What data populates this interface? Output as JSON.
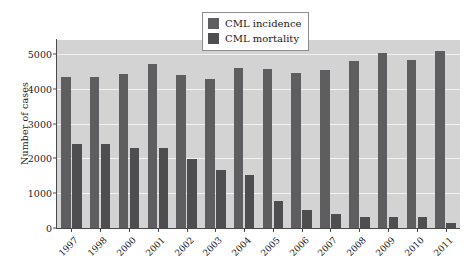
{
  "chart_data": {
    "type": "bar",
    "title": "",
    "subtitle": "",
    "xlabel": "",
    "ylabel": "Number of cases",
    "ylim": [
      0,
      5400
    ],
    "yticks": [
      0,
      1000,
      2000,
      3000,
      4000,
      5000
    ],
    "ytick_labels": [
      "0",
      "1000",
      "2000",
      "3000",
      "4000",
      "5000"
    ],
    "grid": true,
    "grid_axis": "y",
    "legend_position": "top-center",
    "categories": [
      "1997",
      "1998",
      "2000",
      "2001",
      "2002",
      "2003",
      "2004",
      "2005",
      "2006",
      "2007",
      "2008",
      "2009",
      "2010",
      "2011"
    ],
    "series": [
      {
        "name": "CML incidence",
        "color": "#5e5e60",
        "values": [
          4340,
          4340,
          4420,
          4700,
          4400,
          4280,
          4600,
          4580,
          4460,
          4540,
          4800,
          5020,
          4820,
          5080
        ]
      },
      {
        "name": "CML mortality",
        "color": "#4e4e50",
        "values": [
          2400,
          2400,
          2290,
          2290,
          1990,
          1660,
          1530,
          780,
          510,
          400,
          330,
          320,
          310,
          150
        ]
      }
    ]
  },
  "legend": {
    "items": [
      {
        "label": "CML incidence",
        "swatch_color": "#5e5e60",
        "icon": "legend-swatch-icon"
      },
      {
        "label": "CML mortality",
        "swatch_color": "#4e4e50",
        "icon": "legend-swatch-icon"
      }
    ]
  },
  "axes": {
    "y_title": "Number of cases",
    "plot_background": "#d3d3d3",
    "gridline_color": "#f2f2f2",
    "axis_color": "#4a4a4a"
  }
}
